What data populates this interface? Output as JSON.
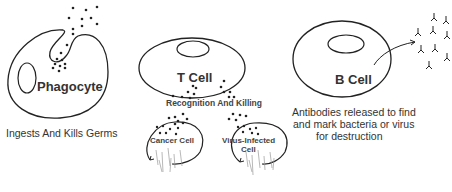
{
  "phagocyte": {
    "label": "Phagocyte",
    "caption": "Ingests And Kills Germs"
  },
  "t_cell": {
    "label": "T Cell",
    "action": "Recognition And Killing",
    "targets": [
      {
        "label": "Cancer Cell"
      },
      {
        "label_line1": "Virus-Infected",
        "label_line2": "Cell"
      }
    ]
  },
  "b_cell": {
    "label": "B Cell",
    "caption_line1": "Antibodies released to find",
    "caption_line2": "and mark bacteria or virus",
    "caption_line3": "for destruction"
  },
  "colors": {
    "stroke": "#222222",
    "text": "#333333",
    "background": "#ffffff"
  }
}
